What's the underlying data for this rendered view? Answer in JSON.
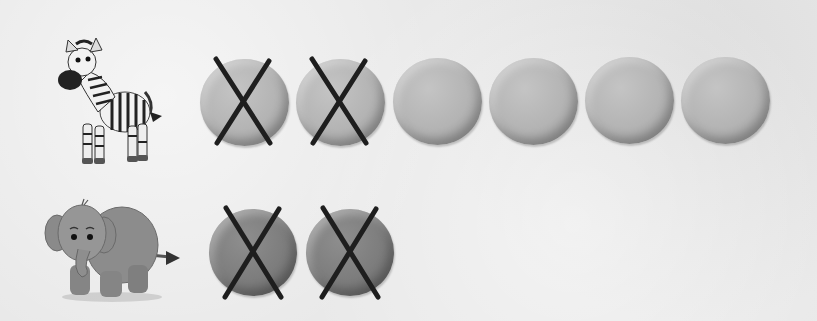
{
  "rows": [
    {
      "animal": "zebra",
      "circle_tone": "light",
      "circles_total": 6,
      "circles_crossed": 2,
      "circles": [
        {
          "x": 200,
          "y": 59,
          "size": 89,
          "crossed": true
        },
        {
          "x": 296,
          "y": 59,
          "size": 89,
          "crossed": true
        },
        {
          "x": 393,
          "y": 58,
          "size": 89,
          "crossed": false
        },
        {
          "x": 489,
          "y": 58,
          "size": 89,
          "crossed": false
        },
        {
          "x": 585,
          "y": 57,
          "size": 89,
          "crossed": false
        },
        {
          "x": 681,
          "y": 57,
          "size": 89,
          "crossed": false
        }
      ]
    },
    {
      "animal": "elephant",
      "circle_tone": "dark",
      "circles_total": 2,
      "circles_crossed": 2,
      "circles": [
        {
          "x": 209,
          "y": 209,
          "size": 88,
          "crossed": true
        },
        {
          "x": 306,
          "y": 209,
          "size": 88,
          "crossed": true
        }
      ]
    }
  ],
  "colors": {
    "background": "#e9e9e9",
    "circle_light": "#b3b3b3",
    "circle_dark": "#7c7c7c",
    "cross_stroke": "#1e1e1e"
  }
}
